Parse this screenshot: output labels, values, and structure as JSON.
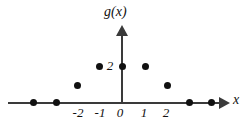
{
  "chart_data": {
    "type": "scatter",
    "title": "",
    "xlabel": "x",
    "ylabel": "g(x)",
    "xlim": [
      -4.8,
      4.8
    ],
    "ylim": [
      -0.4,
      2.6
    ],
    "grid": false,
    "legend": null,
    "x_ticks": [
      -2,
      -1,
      0,
      1,
      2
    ],
    "x_tick_labels": [
      "-2",
      "-1",
      "0",
      "1",
      "2"
    ],
    "y_ticks": [
      2
    ],
    "y_tick_labels": [
      "2"
    ],
    "points": [
      {
        "x": -4,
        "y": 0,
        "px": 33,
        "py": 102
      },
      {
        "x": -3,
        "y": 0,
        "px": 56,
        "py": 102
      },
      {
        "x": -2,
        "y": 1,
        "px": 77,
        "py": 85
      },
      {
        "x": -1,
        "y": 2,
        "px": 99,
        "py": 66
      },
      {
        "x": 0,
        "y": 2,
        "px": 122,
        "py": 66
      },
      {
        "x": 1,
        "y": 2,
        "px": 145,
        "py": 66
      },
      {
        "x": 2,
        "y": 1,
        "px": 167,
        "py": 85
      },
      {
        "x": 3,
        "y": 0,
        "px": 189,
        "py": 102
      },
      {
        "x": 4,
        "y": 0,
        "px": 211,
        "py": 102
      }
    ],
    "tick_positions": {
      "x": [
        {
          "label": "-2",
          "px": 78,
          "py": 105
        },
        {
          "label": "-1",
          "px": 100,
          "py": 105
        },
        {
          "label": "0",
          "px": 120,
          "py": 105
        },
        {
          "label": "1",
          "px": 144,
          "py": 105
        },
        {
          "label": "2",
          "px": 166,
          "py": 105
        }
      ]
    },
    "colors": {
      "point": "#111111",
      "axis": "#3a3a3a",
      "text": "#111111",
      "background": "#ffffff"
    }
  }
}
